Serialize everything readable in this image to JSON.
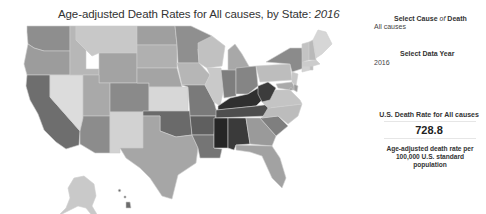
{
  "title": {
    "text": "Age-adjusted Death Rates for All causes, by State:",
    "year": "2016"
  },
  "controls": {
    "cause": {
      "label_prefix": "Select Cause ",
      "label_of": "of",
      "label_suffix": " Death",
      "value": "All causes"
    },
    "year": {
      "label": "Select Data Year",
      "value": "2016"
    }
  },
  "summary": {
    "label": "U.S. Death Rate for All causes",
    "value": "728.8",
    "note": "Age-adjusted death rate per 100,000 U.S. standard population"
  },
  "map": {
    "type": "choropleth",
    "color_scale": "grayscale (lighter = lower rate, darker = higher rate)",
    "states": [
      {
        "id": "WA",
        "fill": "#8e8e8e",
        "d": "M27,8 L70,8 L70,33 L44,33 L34,30 L28,26 L27,14 Z"
      },
      {
        "id": "OR",
        "fill": "#9c9c9c",
        "d": "M28,26 L34,30 L44,33 L70,33 L70,57 L27,57 L24,46 Z"
      },
      {
        "id": "CA",
        "fill": "#6e6e6e",
        "d": "M27,57 L50,57 L50,79 L80,113 L79,127 L66,131 L56,124 L44,112 L38,96 L30,82 L26,68 Z"
      },
      {
        "id": "NV",
        "fill": "#dcdcdc",
        "d": "M50,57 L83,57 L83,100 L80,113 L50,79 Z"
      },
      {
        "id": "ID",
        "fill": "#b7b7b7",
        "d": "M70,8 L76,8 L76,22 L86,32 L86,51 L99,51 L99,57 L70,57 L70,33 Z"
      },
      {
        "id": "MT",
        "fill": "#c8c8c8",
        "d": "M76,8 L137,8 L137,35 L99,35 L92,38 L86,32 L76,22 Z"
      },
      {
        "id": "WY",
        "fill": "#a3a3a3",
        "d": "M99,35 L137,35 L137,65 L99,65 Z"
      },
      {
        "id": "UT",
        "fill": "#a9a9a9",
        "d": "M83,57 L99,57 L99,65 L110,65 L110,98 L83,98 Z"
      },
      {
        "id": "AZ",
        "fill": "#8c8c8c",
        "d": "M83,98 L110,98 L110,135 L95,135 L80,126 L80,113 L83,100 Z"
      },
      {
        "id": "CO",
        "fill": "#8a8a8a",
        "d": "M110,65 L149,65 L149,94 L110,94 Z"
      },
      {
        "id": "NM",
        "fill": "#d2d2d2",
        "d": "M110,94 L143,94 L143,130 L120,130 L120,135 L110,135 Z"
      },
      {
        "id": "ND",
        "fill": "#9f9f9f",
        "d": "M137,8 L175,8 L177,27 L137,27 Z"
      },
      {
        "id": "SD",
        "fill": "#b0b0b0",
        "d": "M137,27 L177,27 L177,50 L137,50 Z"
      },
      {
        "id": "NE",
        "fill": "#a4a4a4",
        "d": "M137,50 L177,50 L182,69 L149,69 L149,65 L137,65 Z"
      },
      {
        "id": "KS",
        "fill": "#d7d7d7",
        "d": "M149,69 L188,69 L188,93 L149,93 Z"
      },
      {
        "id": "OK",
        "fill": "#6a6a6a",
        "d": "M143,93 L190,93 L192,117 L176,119 L160,113 L160,98 L143,98 Z"
      },
      {
        "id": "TX",
        "fill": "#a6a6a6",
        "d": "M143,98 L160,98 L160,113 L176,119 L192,117 L198,130 L196,145 L178,157 L172,181 L162,178 L150,160 L140,150 L126,140 L120,130 L143,130 Z"
      },
      {
        "id": "MN",
        "fill": "#8f8f8f",
        "d": "M175,8 L191,8 L212,18 L198,31 L199,45 L178,45 L177,27 Z"
      },
      {
        "id": "IA",
        "fill": "#b6b6b6",
        "d": "M177,45 L199,45 L210,57 L205,67 L182,67 Z"
      },
      {
        "id": "MO",
        "fill": "#7a7a7a",
        "d": "M182,67 L205,67 L214,84 L218,98 L190,98 L188,69 Z"
      },
      {
        "id": "AR",
        "fill": "#5f5f5f",
        "d": "M190,98 L216,98 L214,117 L192,117 Z"
      },
      {
        "id": "LA",
        "fill": "#757575",
        "d": "M192,117 L214,117 L214,130 L222,131 L220,140 L200,140 L198,130 Z"
      },
      {
        "id": "WI",
        "fill": "#c1c1c1",
        "d": "M198,25 L212,18 L225,28 L222,48 L207,50 L199,45 L198,31 Z"
      },
      {
        "id": "IL",
        "fill": "#c9c9c9",
        "d": "M207,50 L221,50 L224,70 L220,88 L214,84 L205,67 L210,57 Z"
      },
      {
        "id": "MI",
        "fill": "#a8a8a8",
        "d": "M228,32 L235,26 L242,36 L250,50 L242,54 L228,54 Z"
      },
      {
        "id": "IN",
        "fill": "#7e7e7e",
        "d": "M221,52 L236,52 L236,78 L224,80 Z"
      },
      {
        "id": "OH",
        "fill": "#858585",
        "d": "M236,50 L256,48 L258,68 L248,76 L236,76 Z"
      },
      {
        "id": "KY",
        "fill": "#2f2f2f",
        "d": "M218,88 L230,80 L248,76 L258,70 L266,78 L256,88 L218,92 Z"
      },
      {
        "id": "TN",
        "fill": "#4e4e4e",
        "d": "M216,92 L256,88 L272,86 L268,98 L216,100 Z"
      },
      {
        "id": "MS",
        "fill": "#262626",
        "d": "M214,100 L228,100 L228,130 L214,130 Z"
      },
      {
        "id": "AL",
        "fill": "#3a3a3a",
        "d": "M228,100 L246,100 L250,126 L236,127 L234,132 L228,130 Z"
      },
      {
        "id": "GA",
        "fill": "#9a9a9a",
        "d": "M246,100 L260,100 L276,118 L272,128 L250,126 Z"
      },
      {
        "id": "FL",
        "fill": "#a2a2a2",
        "d": "M236,127 L272,128 L280,140 L286,160 L282,170 L272,160 L262,138 L250,134 L236,132 Z"
      },
      {
        "id": "SC",
        "fill": "#7f7f7f",
        "d": "M260,100 L278,98 L288,108 L276,118 Z"
      },
      {
        "id": "NC",
        "fill": "#bcbcbc",
        "d": "M268,90 L302,86 L298,98 L288,106 L278,98 L262,100 Z"
      },
      {
        "id": "VA",
        "fill": "#c4c4c4",
        "d": "M262,84 L276,72 L290,72 L300,82 L302,86 L268,90 Z"
      },
      {
        "id": "WV",
        "fill": "#3c3c3c",
        "d": "M258,68 L268,64 L276,70 L270,82 L262,84 L258,76 Z"
      },
      {
        "id": "PA",
        "fill": "#bdbdbd",
        "d": "M256,48 L290,46 L292,62 L260,64 Z"
      },
      {
        "id": "NY",
        "fill": "#8b8b8b",
        "d": "M266,44 L290,30 L302,30 L304,50 L292,54 L290,46 Z"
      },
      {
        "id": "MD",
        "fill": "#aaaaaa",
        "d": "M276,66 L292,64 L296,72 L290,72 L278,70 Z"
      },
      {
        "id": "NJ",
        "fill": "#c7c7c7",
        "d": "M292,54 L298,56 L296,68 L292,64 Z"
      },
      {
        "id": "DE",
        "fill": "#9a9a9a",
        "d": "M294,66 L298,68 L297,74 L294,72 Z"
      },
      {
        "id": "CT",
        "fill": "#d2d2d2",
        "d": "M302,48 L310,48 L310,52 L302,54 Z"
      },
      {
        "id": "RI",
        "fill": "#bebebe",
        "d": "M310,48 L313,48 L313,52 L310,52 Z"
      },
      {
        "id": "MA",
        "fill": "#cccccc",
        "d": "M302,44 L316,42 L320,46 L313,48 L302,48 Z"
      },
      {
        "id": "VT",
        "fill": "#c3c3c3",
        "d": "M302,26 L309,24 L309,42 L302,44 Z"
      },
      {
        "id": "NH",
        "fill": "#b9b9b9",
        "d": "M309,24 L313,22 L316,42 L309,42 Z"
      },
      {
        "id": "ME",
        "fill": "#d6d6d6",
        "d": "M313,22 L318,12 L326,14 L332,26 L322,36 L316,40 Z"
      },
      {
        "id": "AK",
        "fill": "#c9c9c9",
        "d": "M74,160 L84,158 L94,166 L96,178 L92,188 L98,198 L94,200 L86,190 L78,188 L70,192 L58,198 L66,190 L70,180 L68,170 Z"
      },
      {
        "id": "HI",
        "fill": "#6c6c6c",
        "d": "M118,172 L120,171 L121,173 L119,174 Z M124,178 L126,178 L126,180 L124,180 Z M126,184 L130,184 L131,190 L126,190 Z"
      },
      {
        "id": "DC",
        "fill": "#888888",
        "d": "M290,70 L292,70 L292,72 L290,72 Z"
      }
    ]
  }
}
